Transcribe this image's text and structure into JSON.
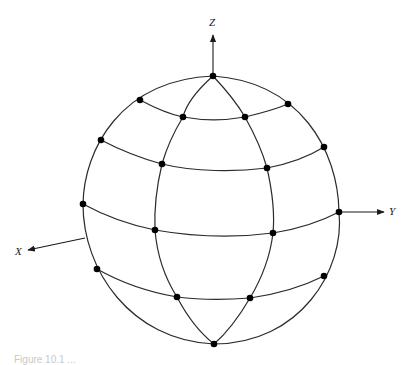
{
  "diagram": {
    "type": "sphere-latitude-longitude-grid",
    "stroke_color": "#2b2b2b",
    "node_color": "#000000",
    "axes": {
      "z": {
        "label": "Z"
      },
      "y": {
        "label": "Y"
      },
      "x": {
        "label": "X"
      }
    },
    "nodes": [
      {
        "id": "north-pole",
        "x": 213,
        "y": 76
      },
      {
        "id": "r1-a",
        "x": 140,
        "y": 100
      },
      {
        "id": "r1-b",
        "x": 183,
        "y": 117
      },
      {
        "id": "r1-c",
        "x": 245,
        "y": 117
      },
      {
        "id": "r1-d",
        "x": 288,
        "y": 104
      },
      {
        "id": "r2-a",
        "x": 101,
        "y": 140
      },
      {
        "id": "r2-b",
        "x": 162,
        "y": 164
      },
      {
        "id": "r2-c",
        "x": 267,
        "y": 168
      },
      {
        "id": "r2-d",
        "x": 324,
        "y": 147
      },
      {
        "id": "r3-a",
        "x": 83,
        "y": 204
      },
      {
        "id": "r3-b",
        "x": 155,
        "y": 230
      },
      {
        "id": "r3-c",
        "x": 273,
        "y": 233
      },
      {
        "id": "r3-d",
        "x": 339,
        "y": 212
      },
      {
        "id": "r4-a",
        "x": 97,
        "y": 269
      },
      {
        "id": "r4-b",
        "x": 177,
        "y": 297
      },
      {
        "id": "r4-c",
        "x": 250,
        "y": 298
      },
      {
        "id": "r4-d",
        "x": 324,
        "y": 276
      },
      {
        "id": "south-pole",
        "x": 214,
        "y": 344
      }
    ]
  },
  "caption": {
    "text": "Figure 10.1  ..."
  }
}
